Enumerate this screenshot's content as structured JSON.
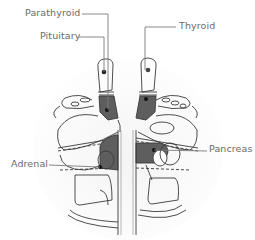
{
  "diagram": {
    "type": "reflexology-foot-map",
    "labels": {
      "parathyroid": "Parathyroid",
      "pituitary": "Pituitary",
      "thyroid": "Thyroid",
      "adrenal": "Adrenal",
      "pancreas": "Pancreas"
    },
    "colors": {
      "outline": "#3a3a3a",
      "highlight_fill": "#5e5e5e",
      "leader_line": "#7a7a7a",
      "label_text": "#6a6a6a",
      "shadow": "#ececec"
    }
  }
}
